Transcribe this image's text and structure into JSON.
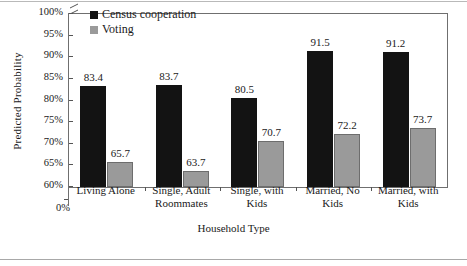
{
  "chart_data": {
    "type": "bar",
    "title": "",
    "xlabel": "Household Type",
    "ylabel": "Predicted Probability",
    "categories": [
      "Living Alone",
      "Single, Adult Roommates",
      "Single, with Kids",
      "Married, No Kids",
      "Married, with Kids"
    ],
    "series": [
      {
        "name": "Census cooperation",
        "color": "#131313",
        "values": [
          83.4,
          83.7,
          80.5,
          91.5,
          91.2
        ]
      },
      {
        "name": "Voting",
        "color": "#9a9a9a",
        "values": [
          65.7,
          63.7,
          70.7,
          72.2,
          73.7
        ]
      }
    ],
    "ylim": [
      60,
      100
    ],
    "yticks": [
      60,
      65,
      70,
      75,
      80,
      85,
      90,
      95,
      100
    ],
    "ytick_labels": [
      "60%",
      "65%",
      "70%",
      "75%",
      "80%",
      "85%",
      "90%",
      "95%",
      "100%"
    ],
    "y_axis_break": true,
    "y_origin_label": "0%",
    "grid": false,
    "legend_position": "inside-top-center",
    "value_labels": true
  },
  "axes": {
    "y_title": "Predicted Probability",
    "x_title": "Household Type",
    "zero_label": "0%"
  },
  "legend": {
    "items": [
      {
        "label": "Census cooperation",
        "swatch": "#131313"
      },
      {
        "label": "Voting",
        "swatch": "#9a9a9a"
      }
    ]
  },
  "xtick_labels": [
    [
      "Living Alone"
    ],
    [
      "Single, Adult",
      "Roommates"
    ],
    [
      "Single, with",
      "Kids"
    ],
    [
      "Married, No",
      "Kids"
    ],
    [
      "Married, with",
      "Kids"
    ]
  ],
  "value_labels": {
    "census": [
      "83.4",
      "83.7",
      "80.5",
      "91.5",
      "91.2"
    ],
    "voting": [
      "65.7",
      "63.7",
      "70.7",
      "72.2",
      "73.7"
    ]
  },
  "ytick_labels": [
    "100%",
    "95%",
    "90%",
    "85%",
    "80%",
    "75%",
    "70%",
    "65%",
    "60%"
  ],
  "colors": {
    "census": "#131313",
    "voting": "#9a9a9a",
    "frame": "#6f6f6f",
    "background": "#ffffff"
  }
}
